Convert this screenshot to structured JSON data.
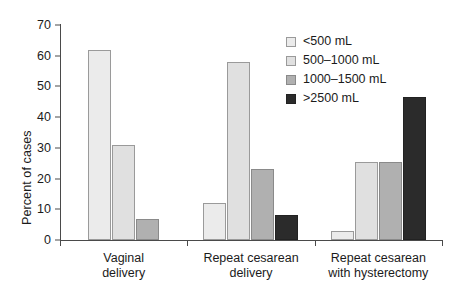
{
  "chart_data": {
    "type": "bar",
    "title": "",
    "xlabel": "",
    "ylabel": "Percent of cases",
    "ylim": [
      0,
      70
    ],
    "yticks": [
      0,
      10,
      20,
      30,
      40,
      50,
      60,
      70
    ],
    "grid": false,
    "legend_position": "top-right",
    "categories": [
      "Vaginal\ndelivery",
      "Repeat cesarean\ndelivery",
      "Repeat cesarean\nwith  hysterectomy"
    ],
    "series": [
      {
        "name": "<500 mL",
        "color": "#ebebeb",
        "values": [
          62,
          12,
          3
        ]
      },
      {
        "name": "500–1000 mL",
        "color": "#e0e0e0",
        "values": [
          31,
          58,
          25.5
        ]
      },
      {
        "name": "1000–1500 mL",
        "color": "#b0b0b0",
        "values": [
          7,
          23,
          25.5
        ]
      },
      {
        "name": ">2500 mL",
        "color": "#2b2b2b",
        "values": [
          null,
          8,
          46.5
        ]
      }
    ]
  },
  "axis": {
    "tick_labels": [
      "0",
      "10",
      "20",
      "30",
      "40",
      "50",
      "60",
      "70"
    ]
  },
  "colors": {
    "axis": "#4a4a4a",
    "text": "#1b1b1b",
    "background": "#ffffff"
  }
}
